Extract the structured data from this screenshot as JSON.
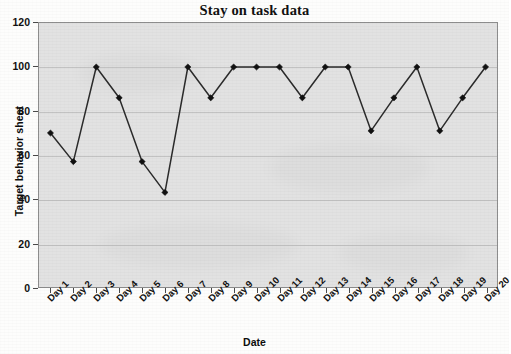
{
  "chart_data": {
    "type": "line",
    "title": "Stay on task data",
    "xlabel": "Date",
    "ylabel": "Target behavior sheet",
    "categories": [
      "Day 1",
      "Day 2",
      "Day 3",
      "Day 4",
      "Day 5",
      "Day 6",
      "Day 7",
      "Day 8",
      "Day 9",
      "Day 10",
      "Day 11",
      "Day 12",
      "Day 13",
      "Day 14",
      "Day 15",
      "Day 16",
      "Day 17",
      "Day 18",
      "Day 19",
      "Day 20"
    ],
    "values": [
      70,
      57,
      100,
      86,
      57,
      43,
      100,
      86,
      100,
      100,
      100,
      86,
      100,
      100,
      71,
      86,
      100,
      71,
      86,
      100
    ],
    "ylim": [
      0,
      120
    ],
    "yticks": [
      0,
      20,
      40,
      60,
      80,
      100,
      120
    ],
    "ytick_labels": [
      "0",
      "20",
      "40",
      "60",
      "80",
      "100",
      "120"
    ],
    "grid": true,
    "legend": false,
    "marker": "diamond",
    "line_color": "#2b2b2b",
    "marker_color": "#111111",
    "plot_background": "#e2e2e2",
    "figure_background": "#fdfdfc"
  }
}
